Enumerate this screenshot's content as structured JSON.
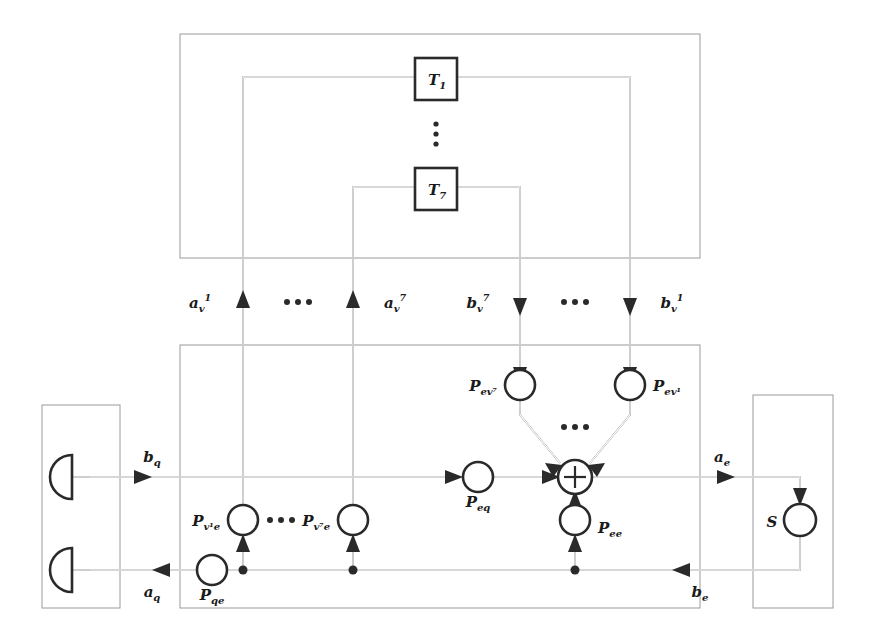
{
  "figure": {
    "type": "signal-flow-diagram",
    "title_visible": false
  },
  "top_group": {
    "name": "transformer-group",
    "blocks": [
      {
        "id": "T1",
        "base": "T",
        "sub": "1"
      },
      {
        "id": "T7",
        "base": "T",
        "sub": "7"
      }
    ],
    "vertical_ellipsis": "⋮"
  },
  "bus_labels": {
    "a_v_1": {
      "base": "a",
      "sub": "v",
      "sup": "1"
    },
    "a_v_7": {
      "base": "a",
      "sub": "v",
      "sup": "7"
    },
    "b_v_7": {
      "base": "b",
      "sub": "v",
      "sup": "7"
    },
    "b_v_1": {
      "base": "b",
      "sub": "v",
      "sup": "1"
    },
    "ellipsis_left": "•••",
    "ellipsis_right": "•••"
  },
  "middle_group": {
    "name": "coupling-network-group",
    "nodes": [
      {
        "id": "P_ev7",
        "base": "P",
        "sub": "ev⁷"
      },
      {
        "id": "P_ev1",
        "base": "P",
        "sub": "ev¹"
      },
      {
        "id": "P_eq",
        "base": "P",
        "sub": "eq"
      },
      {
        "id": "P_ee",
        "base": "P",
        "sub": "ee"
      },
      {
        "id": "P_qe",
        "base": "P",
        "sub": "qe"
      },
      {
        "id": "P_v1e",
        "base": "P",
        "sub": "v¹e"
      },
      {
        "id": "P_v7e",
        "base": "P",
        "sub": "v⁷e"
      }
    ],
    "summation_node": "⊕",
    "ellipsis_converge": "•••",
    "ellipsis_row": "•••"
  },
  "signal_labels": {
    "b_q": {
      "base": "b",
      "sub": "q"
    },
    "a_q": {
      "base": "a",
      "sub": "q"
    },
    "a_e": {
      "base": "a",
      "sub": "e"
    },
    "b_e": {
      "base": "b",
      "sub": "e"
    }
  },
  "left_group": {
    "name": "port-terminal-group",
    "terminals": [
      "port-top",
      "port-bottom"
    ]
  },
  "right_group": {
    "name": "scattering-group",
    "node": {
      "id": "S",
      "base": "S"
    }
  },
  "colors": {
    "line": "#2a2a2a",
    "group_border": "#9a9a9a",
    "background": "#ffffff"
  }
}
